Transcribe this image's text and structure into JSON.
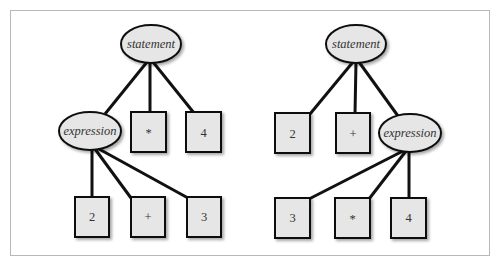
{
  "figure": {
    "colors": {
      "node_fill": "#e6e6e6",
      "node_stroke": "#111111",
      "edge": "#111111",
      "frame": "#b8b8b8",
      "text": "#333333"
    }
  },
  "trees": [
    {
      "name": "left-tree",
      "root": {
        "label": "statement",
        "shape": "ellipse",
        "cx": 151,
        "cy": 44
      },
      "children": [
        {
          "label": "expression",
          "shape": "ellipse",
          "cx": 90,
          "cy": 131
        },
        {
          "label": "*",
          "shape": "box",
          "x": 131,
          "y": 112
        },
        {
          "label": "4",
          "shape": "box",
          "x": 186,
          "y": 112
        }
      ],
      "grandchildren": [
        {
          "label": "2",
          "shape": "box",
          "x": 75,
          "y": 197
        },
        {
          "label": "+",
          "shape": "box",
          "x": 131,
          "y": 197
        },
        {
          "label": "3",
          "shape": "box",
          "x": 187,
          "y": 197
        }
      ]
    },
    {
      "name": "right-tree",
      "root": {
        "label": "statement",
        "shape": "ellipse",
        "cx": 356,
        "cy": 44
      },
      "children": [
        {
          "label": "2",
          "shape": "box",
          "x": 275,
          "y": 113
        },
        {
          "label": "+",
          "shape": "box",
          "x": 336,
          "y": 113
        },
        {
          "label": "expression",
          "shape": "ellipse",
          "cx": 410,
          "cy": 133
        }
      ],
      "grandchildren": [
        {
          "label": "3",
          "shape": "box",
          "x": 275,
          "y": 198
        },
        {
          "label": "*",
          "shape": "box",
          "x": 335,
          "y": 198
        },
        {
          "label": "4",
          "shape": "box",
          "x": 391,
          "y": 198
        }
      ]
    }
  ],
  "labels": {
    "left_statement": "statement",
    "left_expression": "expression",
    "left_mult": "*",
    "left_four": "4",
    "left_two": "2",
    "left_plus": "+",
    "left_three": "3",
    "right_statement": "statement",
    "right_two": "2",
    "right_plus": "+",
    "right_expression": "expression",
    "right_three": "3",
    "right_mult": "*",
    "right_four": "4"
  }
}
